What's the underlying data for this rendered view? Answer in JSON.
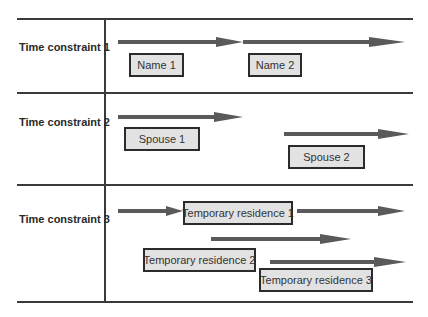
{
  "diagram": {
    "colors": {
      "line": "#3a3a3a",
      "arrow": "#5a5a5a",
      "box_fill": "#e2e2e2",
      "box_border": "#2b2b2b",
      "text": "#2a2a2a"
    },
    "rows": [
      {
        "label": "Time constraint 1",
        "boxes": [
          {
            "text": "Name 1"
          },
          {
            "text": "Name 2"
          }
        ]
      },
      {
        "label": "Time constraint 2",
        "boxes": [
          {
            "text": "Spouse 1"
          },
          {
            "text": "Spouse 2"
          }
        ]
      },
      {
        "label": "Time constraint 3",
        "boxes": [
          {
            "text": "Temporary residence 1"
          },
          {
            "text": "Temporary residence 2"
          },
          {
            "text": "Temporary residence 3"
          }
        ]
      }
    ]
  }
}
